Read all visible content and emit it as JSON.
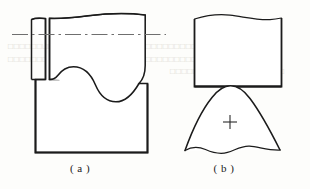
{
  "figure": {
    "caption_a": "( a )",
    "caption_b": "( b )",
    "stroke_color": "#1b1b1b",
    "thin_stroke_color": "#3a3a3a",
    "centerline_color": "#6f6f6f",
    "background_color": "#fdfdfb"
  },
  "panel_a": {
    "name": "view-a",
    "elements": {
      "centerline": "dash-dot-horizontal-centerline",
      "break_line_top": "wavy-break-line",
      "notch": "s-curve-concave-notch",
      "rounded_corner": "quarter-round-right-corner",
      "lower_block": "rectangular-base-block",
      "narrow_strip": "vertical-narrow-strip"
    }
  },
  "panel_b": {
    "name": "view-b",
    "elements": {
      "break_line_top": "wavy-break-line",
      "upper_block": "rectangular-block",
      "bell_form": "bell-shaped-profile",
      "center_mark": "+",
      "break_line_bottom": "wavy-break-line"
    }
  },
  "bleed": {
    "line1": "□□□□□□□□□□□□□□□□□□□□□□□□□□□□□□□□□□",
    "line2": "□□□□□□□□□□□□□□□□□□□□□□□□□□□□□□□□□□",
    "line3": "□□□□□□□□□□□□□□□□□□□□"
  }
}
